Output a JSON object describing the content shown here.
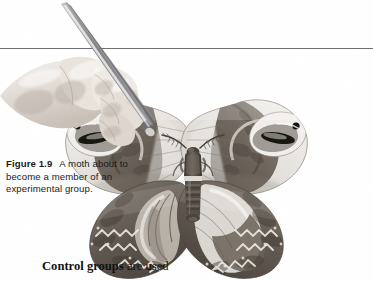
{
  "page": {
    "background_color": "#ffffff",
    "width": 373,
    "height": 281
  },
  "rule": {
    "name": "horizontal-rule",
    "color": "#6e6e70"
  },
  "figure": {
    "caption": {
      "label": "Figure 1.9",
      "line1": "A moth",
      "line2": "about to  become",
      "line3": "a member of an",
      "line4": "experimental group."
    },
    "image": {
      "alt": "A large moth with patterned wings being held by a pair of forceps in a human hand",
      "subject": "moth",
      "tool": "forceps",
      "hand": "human-hand"
    }
  },
  "body": {
    "lead": "Control groups",
    "rest": " are used"
  },
  "colors": {
    "text": "#1a1a1a",
    "body_text": "#111111",
    "rule": "#6e6e70",
    "wing_dark": "#6b6158",
    "wing_light": "#e8e6e2",
    "wing_mid": "#9a9089",
    "body_dark": "#4a4239",
    "skin": "#e3dcd6",
    "forceps": "#8d8d8f"
  }
}
